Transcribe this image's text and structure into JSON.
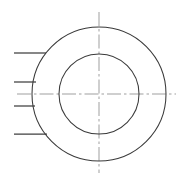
{
  "drawing": {
    "title": "Concentric Circular Part — Front View",
    "kind": "engineering-line-drawing",
    "canvas": {
      "width": 186,
      "height": 182,
      "background": "#ffffff"
    },
    "colors": {
      "outline": "#3a3a3a",
      "leader": "#3f3f3f",
      "centerline": "#8e8e8e",
      "background": "#ffffff"
    },
    "center": {
      "x": 99,
      "y": 94
    },
    "circles": [
      {
        "name": "outer-circle",
        "cx": 99,
        "cy": 94,
        "r": 67,
        "stroke": "#3a3a3a",
        "stroke_width": 1.05
      },
      {
        "name": "inner-circle",
        "cx": 99,
        "cy": 94,
        "r": 40,
        "stroke": "#3a3a3a",
        "stroke_width": 1.05
      }
    ],
    "centerlines": [
      {
        "name": "horizontal-centerline",
        "orientation": "horizontal",
        "x1": 17,
        "y1": 94,
        "x2": 176,
        "y2": 94,
        "dash_pattern": "14,3,2.5,3"
      },
      {
        "name": "vertical-centerline",
        "orientation": "vertical",
        "x1": 99,
        "y1": 12,
        "x2": 99,
        "y2": 173,
        "dash_pattern": "14,3,2.5,3"
      }
    ],
    "leader_lines": [
      {
        "name": "leader-line-1",
        "x1": 14,
        "y1": 53,
        "x2": 46,
        "y2": 53
      },
      {
        "name": "leader-line-2",
        "x1": 14,
        "y1": 82,
        "x2": 36,
        "y2": 82
      },
      {
        "name": "leader-line-3",
        "x1": 14,
        "y1": 106,
        "x2": 35,
        "y2": 106
      },
      {
        "name": "leader-line-4",
        "x1": 14,
        "y1": 134,
        "x2": 47,
        "y2": 134
      }
    ],
    "labels": []
  }
}
